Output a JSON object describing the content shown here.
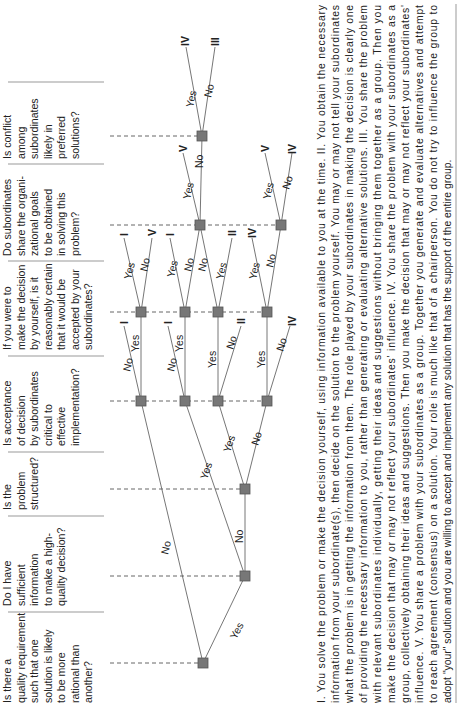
{
  "questions": [
    {
      "id": "A",
      "lines": [
        "Is there a",
        "quality requirement",
        "such that one",
        "solution is likely",
        "to be more",
        "rational than",
        "another?"
      ]
    },
    {
      "id": "B",
      "lines": [
        "Do I have",
        "sufficient",
        "information",
        "to make a high-",
        "quality decision?"
      ]
    },
    {
      "id": "C",
      "lines": [
        "Is the",
        "problem",
        "structured?"
      ]
    },
    {
      "id": "D",
      "lines": [
        "Is acceptance",
        "of decision",
        "by subordinates",
        "critical to",
        "effective",
        "implementation?"
      ]
    },
    {
      "id": "E",
      "lines": [
        "If you were to",
        "make the decision",
        "by yourself, is it",
        "reasonably certain",
        "that it would be",
        "accepted by your",
        "subordinates?"
      ]
    },
    {
      "id": "F",
      "lines": [
        "Do subordinates",
        "share the organi-",
        "zational goals",
        "to be obtained",
        "in solving this",
        "problem?"
      ]
    },
    {
      "id": "G",
      "lines": [
        "Is conflict",
        "among",
        "subordinates",
        "likely in",
        "preferred",
        "solutions?"
      ]
    }
  ],
  "edge_labels": {
    "yes": "Yes",
    "no": "No"
  },
  "outcomes": {
    "I": "I",
    "II": "II",
    "III": "III",
    "IV": "IV",
    "V": "V"
  },
  "leaves": [
    {
      "label": "I",
      "x": 124,
      "y": 232
    },
    {
      "label": "V",
      "x": 152,
      "y": 232
    },
    {
      "label": "I",
      "x": 170,
      "y": 232
    },
    {
      "label": "II",
      "x": 232,
      "y": 232
    },
    {
      "label": "IV",
      "x": 252,
      "y": 232
    },
    {
      "label": "I",
      "x": 124,
      "y": 320
    },
    {
      "label": "I",
      "x": 168,
      "y": 320
    },
    {
      "label": "II",
      "x": 241,
      "y": 320
    },
    {
      "label": "IV",
      "x": 292,
      "y": 320
    },
    {
      "label": "V",
      "x": 183,
      "y": 148
    },
    {
      "label": "V",
      "x": 265,
      "y": 148
    },
    {
      "label": "IV",
      "x": 292,
      "y": 148
    },
    {
      "label": "IV",
      "x": 185,
      "y": 40
    },
    {
      "label": "III",
      "x": 215,
      "y": 40
    }
  ],
  "explanation": {
    "lines": [
      "I. You solve the problem or make the decision yourself, using information available to you at the time. II. You obtain the necessary",
      "information from your subordinate(s), then decide on the solution to the problem yourself. You may or may not tell your subordinates",
      "what the problem is in getting the information from them. The role played by your subordinates in making the decision is clearly one",
      "of providing the necessary information to you, rather than generating or evaluating alternative solutions. III. You share the problem",
      "with relevant subordinates individually, getting their ideas and suggestions without bringing them together as a group. Then you",
      "make the decision that may or may not reflect your subordinates' influence. IV. You share the problem with your subordinates as a",
      "group, collectively obtaining their ideas and suggestions. Then you make the decision that may or may not reflect your subordinates'",
      "influence. V. You share a problem with your subordinates as a group. Together you generate and evaluate alternatives and attempt",
      "to reach agreement (consensus) on a solution. Your role is much like that of a chairperson. You do not try to influence the group to",
      "adopt \"your\" solution and you are willing to accept and implement any solution that has the support of the entire group."
    ]
  },
  "colors": {
    "node": "#777777",
    "edge": "#666666",
    "text": "#222222",
    "rule": "#999999"
  }
}
